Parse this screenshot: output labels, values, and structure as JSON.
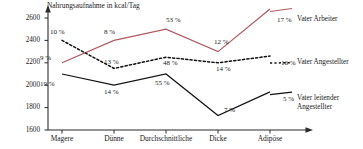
{
  "chart_data": {
    "type": "line",
    "title": "Nahrungsaufnahme in kcal/Tag",
    "xlabel": "",
    "ylabel": "Nahrungsaufnahme in kcal/Tag",
    "categories": [
      "Magere",
      "Dünne",
      "Durchschnittliche",
      "Dicke",
      "Adipöse"
    ],
    "ylim": [
      1600,
      2700
    ],
    "yticks": [
      1600,
      1800,
      2000,
      2200,
      2400,
      2600
    ],
    "ytick_labels": [
      "1600",
      "1800",
      "2000",
      "2200",
      "2400",
      "2600"
    ],
    "grid": false,
    "legend_position": "right",
    "series": [
      {
        "name": "Vater Arbeiter",
        "color": "#b05a5f",
        "style": "solid",
        "values": [
          2200,
          2400,
          2500,
          2300,
          2680
        ],
        "point_labels": [
          "9 %",
          "8 %",
          "53 %",
          "12 %",
          "17 %"
        ]
      },
      {
        "name": "Vater Angestellter",
        "color": "#111111",
        "style": "dotted",
        "values": [
          2400,
          2150,
          2250,
          2200,
          2260
        ],
        "point_labels": [
          "10 %",
          "13 %",
          "48 %",
          "14 %",
          "16 %"
        ]
      },
      {
        "name": "Vater leitender Angestellter",
        "color": "#111111",
        "style": "solid",
        "values": [
          2100,
          2000,
          2100,
          1730,
          1940
        ],
        "point_labels": [
          "19 %",
          "14 %",
          "55 %",
          "7 %",
          "5 %"
        ]
      }
    ]
  },
  "axis": {
    "title": "Nahrungsaufnahme in kcal/Tag",
    "y_labels": [
      "2600",
      "2400",
      "2200",
      "2000",
      "1800",
      "1600"
    ],
    "x_labels": [
      "Magere",
      "Dünne",
      "Durchschnittliche",
      "Dicke",
      "Adipöse"
    ]
  },
  "annotations": {
    "arbeiter": [
      "9 %",
      "8 %",
      "53 %",
      "12 %",
      "17 %"
    ],
    "angestellter": [
      "10 %",
      "13 %",
      "48 %",
      "14 %",
      "16 %"
    ],
    "leitender": [
      "19 %",
      "14 %",
      "55 %",
      "7 %",
      "5 %"
    ]
  },
  "legend": {
    "arbeiter": "Vater Arbeiter",
    "angestellter": "Vater Angestellter",
    "leitender_line1": "Vater leitender",
    "leitender_line2": "Angestellter"
  },
  "colors": {
    "series_red": "#b05a5f",
    "series_black": "#111111",
    "axis": "#2b2b2b"
  }
}
